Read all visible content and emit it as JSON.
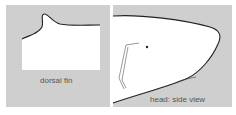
{
  "diagram": {
    "panels": [
      {
        "id": "dorsal-fin",
        "label": "dorsal fin"
      },
      {
        "id": "head-side-view",
        "label": "head: side view"
      }
    ],
    "colors": {
      "panel_bg": "#cfcfcf",
      "body_fill": "#ffffff",
      "outline": "#222222"
    }
  }
}
